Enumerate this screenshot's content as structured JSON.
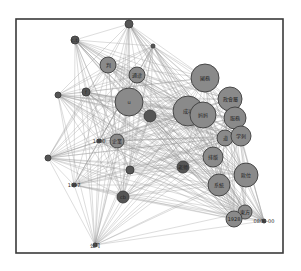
{
  "diagram": {
    "type": "network-graph",
    "frame": {
      "x": 16,
      "y": 19,
      "width": 267,
      "height": 234
    },
    "colors": {
      "node_fill": "#8a8a8a",
      "node_dark": "#555555",
      "node_stroke": "#3c3c3c",
      "edge": "#9a9a9a",
      "frame": "#3a3a3a"
    },
    "nodes": [
      {
        "id": "n1",
        "label": "c.t.",
        "x": 75,
        "y": 40,
        "r": 4,
        "dark": true
      },
      {
        "id": "n2",
        "label": "",
        "x": 129,
        "y": 24,
        "r": 4,
        "dark": true
      },
      {
        "id": "n3",
        "label": "判",
        "x": 108,
        "y": 65,
        "r": 8
      },
      {
        "id": "n4",
        "label": "通途",
        "x": 137,
        "y": 75,
        "r": 8
      },
      {
        "id": "n5",
        "label": "",
        "x": 153,
        "y": 46,
        "r": 2,
        "dark": true
      },
      {
        "id": "n6",
        "label": "",
        "x": 58,
        "y": 95,
        "r": 3,
        "dark": true
      },
      {
        "id": "n7",
        "label": "f",
        "x": 86,
        "y": 92,
        "r": 4,
        "dark": true
      },
      {
        "id": "n8",
        "label": "u",
        "x": 129,
        "y": 102,
        "r": 14
      },
      {
        "id": "n9",
        "label": "國務",
        "x": 205,
        "y": 78,
        "r": 14
      },
      {
        "id": "n10",
        "label": "成功",
        "x": 188,
        "y": 111,
        "r": 15
      },
      {
        "id": "n11",
        "label": "妈妈",
        "x": 203,
        "y": 115,
        "r": 13
      },
      {
        "id": "n12",
        "label": "政會屬",
        "x": 230,
        "y": 99,
        "r": 12
      },
      {
        "id": "n13",
        "label": "服務",
        "x": 235,
        "y": 118,
        "r": 11
      },
      {
        "id": "n14",
        "label": "道",
        "x": 225,
        "y": 138,
        "r": 8
      },
      {
        "id": "n15",
        "label": "学刺",
        "x": 241,
        "y": 136,
        "r": 10
      },
      {
        "id": "n16",
        "label": "排版",
        "x": 213,
        "y": 157,
        "r": 10
      },
      {
        "id": "n17",
        "label": "歐位",
        "x": 246,
        "y": 175,
        "r": 12
      },
      {
        "id": "n18",
        "label": "系統",
        "x": 219,
        "y": 185,
        "r": 11
      },
      {
        "id": "n19",
        "label": "東方",
        "x": 245,
        "y": 212,
        "r": 7
      },
      {
        "id": "n20",
        "label": "1928",
        "x": 234,
        "y": 219,
        "r": 8
      },
      {
        "id": "n21",
        "label": "0806-00",
        "x": 264,
        "y": 221,
        "r": 2,
        "dark": true
      },
      {
        "id": "n22",
        "label": "",
        "x": 150,
        "y": 116,
        "r": 6,
        "dark": true
      },
      {
        "id": "n23",
        "label": "1000",
        "x": 99,
        "y": 141,
        "r": 2,
        "dark": true
      },
      {
        "id": "n24",
        "label": "企業",
        "x": 117,
        "y": 141,
        "r": 7
      },
      {
        "id": "n25",
        "label": "老师",
        "x": 183,
        "y": 167,
        "r": 6,
        "dark": true
      },
      {
        "id": "n26",
        "label": "",
        "x": 48,
        "y": 158,
        "r": 3,
        "dark": true
      },
      {
        "id": "n27",
        "label": "1997",
        "x": 74,
        "y": 185,
        "r": 2,
        "dark": true
      },
      {
        "id": "n28",
        "label": "",
        "x": 130,
        "y": 170,
        "r": 4,
        "dark": true
      },
      {
        "id": "n29",
        "label": "cb",
        "x": 123,
        "y": 197,
        "r": 6,
        "dark": true
      },
      {
        "id": "n30",
        "label": "公司",
        "x": 95,
        "y": 245,
        "r": 2,
        "dark": true
      }
    ]
  }
}
